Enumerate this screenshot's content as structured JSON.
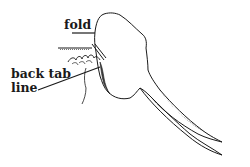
{
  "diagram": {
    "labels": {
      "fold": "fold",
      "back_tab_line_1": "back tab",
      "back_tab_line_2": "line"
    },
    "colors": {
      "ink": "#1a1a1a",
      "shade": "#444444",
      "background": "#ffffff"
    }
  }
}
